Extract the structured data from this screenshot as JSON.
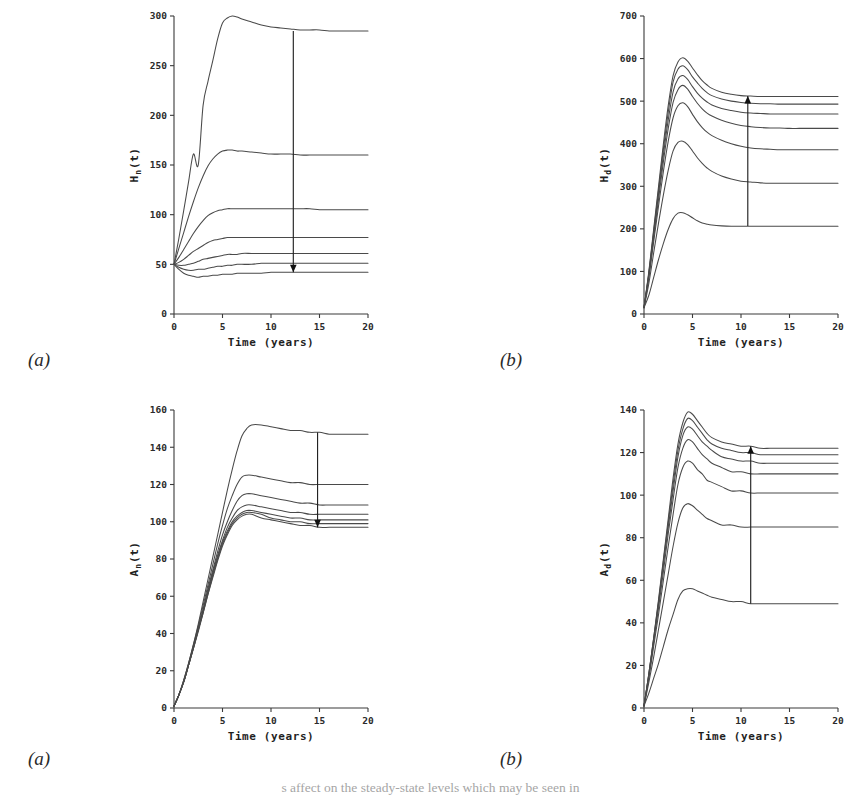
{
  "figure": {
    "panel_tags": [
      "(a)",
      "(b)",
      "(a)",
      "(b)"
    ],
    "caption_fragment": "s affect on the steady-state levels which may be seen in"
  },
  "chart_data": [
    {
      "id": "panel-top-left",
      "type": "line",
      "title": "",
      "xlabel": "Time (years)",
      "ylabel": "H_n(t)",
      "ylabel_base": "H",
      "ylabel_sub": "n",
      "ylabel_tail": "(t)",
      "xlim": [
        0,
        20
      ],
      "ylim": [
        0,
        300
      ],
      "xticks": [
        0,
        5,
        10,
        15,
        20
      ],
      "yticks": [
        0,
        50,
        100,
        150,
        200,
        250,
        300
      ],
      "grid": false,
      "legend": "none",
      "arrow": {
        "x": 12.3,
        "y_from": 285,
        "y_to": 42,
        "direction": "down"
      },
      "x": [
        0,
        0.5,
        1,
        1.5,
        2,
        2.5,
        3,
        3.5,
        4,
        4.5,
        5,
        5.5,
        6,
        6.5,
        7,
        8,
        9,
        10,
        11,
        12,
        13,
        14,
        15,
        16,
        17,
        18,
        19,
        20
      ],
      "series": [
        {
          "name": "curve-1",
          "values": [
            50,
            76,
            104,
            133,
            161,
            150,
            210,
            234,
            255,
            277,
            293,
            298,
            300,
            299,
            297,
            294,
            291,
            289,
            288,
            287,
            286,
            286,
            286,
            285,
            285,
            285,
            285,
            285
          ]
        },
        {
          "name": "curve-2",
          "values": [
            50,
            66,
            82,
            98,
            113,
            127,
            139,
            149,
            156,
            161,
            164,
            165,
            165,
            164,
            164,
            163,
            162,
            161,
            161,
            161,
            160,
            160,
            160,
            160,
            160,
            160,
            160,
            160
          ]
        },
        {
          "name": "curve-3",
          "values": [
            50,
            57,
            65,
            73,
            81,
            88,
            94,
            99,
            102,
            104,
            105,
            106,
            106,
            106,
            106,
            106,
            106,
            106,
            106,
            106,
            106,
            106,
            105,
            105,
            105,
            105,
            105,
            105
          ]
        },
        {
          "name": "curve-4",
          "values": [
            50,
            52,
            55,
            59,
            63,
            66,
            69,
            72,
            74,
            75,
            76,
            77,
            77,
            77,
            77,
            77,
            77,
            77,
            77,
            77,
            77,
            77,
            77,
            77,
            77,
            77,
            77,
            77
          ]
        },
        {
          "name": "curve-5",
          "values": [
            50,
            49,
            49,
            50,
            51,
            53,
            55,
            56,
            57,
            58,
            59,
            60,
            60,
            60,
            61,
            61,
            61,
            61,
            61,
            61,
            61,
            61,
            61,
            61,
            61,
            61,
            61,
            61
          ]
        },
        {
          "name": "curve-6",
          "values": [
            50,
            47,
            45,
            44,
            44,
            45,
            45,
            46,
            47,
            48,
            48,
            49,
            49,
            50,
            50,
            50,
            51,
            51,
            51,
            51,
            51,
            51,
            51,
            51,
            51,
            51,
            51,
            51
          ]
        },
        {
          "name": "curve-7",
          "values": [
            50,
            45,
            41,
            39,
            38,
            37,
            38,
            38,
            39,
            39,
            40,
            40,
            40,
            41,
            41,
            41,
            41,
            42,
            42,
            42,
            42,
            42,
            42,
            42,
            42,
            42,
            42,
            42
          ]
        }
      ]
    },
    {
      "id": "panel-top-right",
      "type": "line",
      "title": "",
      "xlabel": "Time (years)",
      "ylabel": "H_d(t)",
      "ylabel_base": "H",
      "ylabel_sub": "d",
      "ylabel_tail": "(t)",
      "xlim": [
        0,
        20
      ],
      "ylim": [
        0,
        700
      ],
      "xticks": [
        0,
        5,
        10,
        15,
        20
      ],
      "yticks": [
        0,
        100,
        200,
        300,
        400,
        500,
        600,
        700
      ],
      "grid": false,
      "legend": "none",
      "arrow": {
        "x": 10.7,
        "y_from": 207,
        "y_to": 512,
        "direction": "up"
      },
      "x": [
        0,
        0.5,
        1,
        1.5,
        2,
        2.5,
        3,
        3.5,
        4,
        4.5,
        5,
        5.5,
        6,
        6.5,
        7,
        8,
        9,
        10,
        11,
        12,
        13,
        14,
        15,
        16,
        17,
        18,
        19,
        20
      ],
      "series": [
        {
          "name": "curve-1",
          "values": [
            15,
            100,
            200,
            300,
            400,
            490,
            560,
            592,
            602,
            594,
            578,
            562,
            548,
            538,
            530,
            521,
            516,
            513,
            512,
            511,
            511,
            511,
            511,
            511,
            511,
            511,
            511,
            511
          ]
        },
        {
          "name": "curve-2",
          "values": [
            15,
            97,
            194,
            291,
            388,
            474,
            545,
            575,
            583,
            574,
            557,
            543,
            530,
            520,
            513,
            505,
            500,
            497,
            495,
            494,
            494,
            493,
            493,
            493,
            493,
            493,
            493,
            493
          ]
        },
        {
          "name": "curve-3",
          "values": [
            15,
            94,
            188,
            282,
            374,
            456,
            522,
            552,
            560,
            551,
            534,
            519,
            507,
            498,
            491,
            483,
            478,
            474,
            472,
            471,
            470,
            470,
            470,
            470,
            470,
            470,
            470,
            470
          ]
        },
        {
          "name": "curve-4",
          "values": [
            15,
            90,
            180,
            270,
            358,
            436,
            497,
            527,
            537,
            528,
            511,
            495,
            482,
            472,
            465,
            455,
            448,
            443,
            440,
            438,
            437,
            437,
            436,
            436,
            436,
            436,
            436,
            436
          ]
        },
        {
          "name": "curve-5",
          "values": [
            15,
            85,
            170,
            254,
            335,
            406,
            461,
            489,
            496,
            487,
            469,
            452,
            438,
            427,
            419,
            408,
            400,
            394,
            390,
            388,
            387,
            386,
            386,
            386,
            386,
            386,
            386,
            386
          ]
        },
        {
          "name": "curve-6",
          "values": [
            15,
            72,
            144,
            214,
            280,
            338,
            383,
            403,
            406,
            398,
            383,
            367,
            354,
            343,
            335,
            324,
            317,
            312,
            310,
            308,
            307,
            307,
            307,
            307,
            307,
            307,
            307,
            307
          ]
        },
        {
          "name": "curve-7",
          "values": [
            15,
            44,
            86,
            128,
            166,
            199,
            224,
            237,
            238,
            233,
            226,
            219,
            214,
            211,
            209,
            207,
            206,
            206,
            206,
            206,
            206,
            206,
            206,
            206,
            206,
            206,
            206,
            206
          ]
        }
      ]
    },
    {
      "id": "panel-bottom-left",
      "type": "line",
      "title": "",
      "xlabel": "Time (years)",
      "ylabel": "A_n(t)",
      "ylabel_base": "A",
      "ylabel_sub": "n",
      "ylabel_tail": "(t)",
      "xlim": [
        0,
        20
      ],
      "ylim": [
        0,
        160
      ],
      "xticks": [
        0,
        5,
        10,
        15,
        20
      ],
      "yticks": [
        0,
        20,
        40,
        60,
        80,
        100,
        120,
        140,
        160
      ],
      "grid": false,
      "legend": "none",
      "arrow": {
        "x": 14.8,
        "y_from": 148,
        "y_to": 97,
        "direction": "down"
      },
      "x": [
        0,
        0.5,
        1,
        1.5,
        2,
        2.5,
        3,
        3.5,
        4,
        4.5,
        5,
        5.5,
        6,
        6.5,
        7,
        7.5,
        8,
        9,
        10,
        11,
        12,
        13,
        14,
        15,
        16,
        17,
        18,
        19,
        20
      ],
      "series": [
        {
          "name": "curve-1",
          "values": [
            1,
            7,
            15,
            24,
            34,
            45,
            57,
            69,
            81,
            93,
            105,
            117,
            128,
            138,
            146,
            150,
            152,
            152,
            151,
            150,
            149,
            149,
            148,
            148,
            147,
            147,
            147,
            147,
            147
          ]
        },
        {
          "name": "curve-2",
          "values": [
            1,
            7,
            15,
            24,
            34,
            44,
            55,
            66,
            77,
            88,
            98,
            107,
            114,
            120,
            124,
            125,
            125,
            124,
            123,
            122,
            121,
            121,
            120,
            120,
            120,
            120,
            120,
            120,
            120
          ]
        },
        {
          "name": "curve-3",
          "values": [
            1,
            7,
            14,
            23,
            33,
            43,
            53,
            64,
            74,
            84,
            93,
            100,
            106,
            111,
            114,
            115,
            115,
            114,
            113,
            112,
            111,
            110,
            110,
            109,
            109,
            109,
            109,
            109,
            109
          ]
        },
        {
          "name": "curve-4",
          "values": [
            1,
            7,
            14,
            23,
            33,
            42,
            52,
            63,
            73,
            82,
            90,
            97,
            102,
            106,
            108,
            109,
            109,
            108,
            107,
            106,
            105,
            105,
            104,
            104,
            104,
            104,
            104,
            104,
            104
          ]
        },
        {
          "name": "curve-5",
          "values": [
            1,
            7,
            14,
            23,
            32,
            42,
            52,
            62,
            72,
            81,
            89,
            95,
            100,
            103,
            105,
            106,
            106,
            105,
            104,
            103,
            102,
            102,
            101,
            101,
            101,
            101,
            101,
            101,
            101
          ]
        },
        {
          "name": "curve-6",
          "values": [
            1,
            7,
            14,
            23,
            32,
            42,
            51,
            61,
            71,
            80,
            88,
            94,
            99,
            102,
            104,
            105,
            105,
            104,
            102,
            101,
            100,
            100,
            99,
            99,
            99,
            99,
            99,
            99,
            99
          ]
        },
        {
          "name": "curve-7",
          "values": [
            1,
            7,
            14,
            23,
            32,
            41,
            51,
            61,
            70,
            79,
            87,
            93,
            98,
            101,
            103,
            104,
            104,
            102,
            101,
            100,
            99,
            98,
            98,
            97,
            97,
            97,
            97,
            97,
            97
          ]
        }
      ]
    },
    {
      "id": "panel-bottom-right",
      "type": "line",
      "title": "",
      "xlabel": "Time (years)",
      "ylabel": "A_d(t)",
      "ylabel_base": "A",
      "ylabel_sub": "d",
      "ylabel_tail": "(t)",
      "xlim": [
        0,
        20
      ],
      "ylim": [
        0,
        140
      ],
      "xticks": [
        0,
        5,
        10,
        15,
        20
      ],
      "yticks": [
        0,
        20,
        40,
        60,
        80,
        100,
        120,
        140
      ],
      "grid": false,
      "legend": "none",
      "arrow": {
        "x": 11.0,
        "y_from": 49,
        "y_to": 123,
        "direction": "up"
      },
      "x": [
        0,
        0.5,
        1,
        1.5,
        2,
        2.5,
        3,
        3.5,
        4,
        4.5,
        5,
        5.5,
        6,
        6.5,
        7,
        8,
        9,
        10,
        11,
        12,
        13,
        14,
        15,
        16,
        17,
        18,
        19,
        20
      ],
      "series": [
        {
          "name": "curve-1",
          "values": [
            1,
            16,
            33,
            51,
            70,
            89,
            108,
            124,
            134,
            139,
            138,
            135,
            132,
            129,
            127,
            125,
            124,
            123,
            123,
            122,
            122,
            122,
            122,
            122,
            122,
            122,
            122,
            122
          ]
        },
        {
          "name": "curve-2",
          "values": [
            1,
            16,
            33,
            50,
            69,
            87,
            105,
            121,
            131,
            136,
            135,
            132,
            129,
            126,
            124,
            122,
            121,
            120,
            120,
            119,
            119,
            119,
            119,
            119,
            119,
            119,
            119,
            119
          ]
        },
        {
          "name": "curve-3",
          "values": [
            1,
            16,
            32,
            49,
            67,
            85,
            102,
            118,
            128,
            132,
            131,
            128,
            125,
            123,
            121,
            118,
            117,
            116,
            116,
            115,
            115,
            115,
            115,
            115,
            115,
            115,
            115,
            115
          ]
        },
        {
          "name": "curve-4",
          "values": [
            1,
            15,
            31,
            47,
            64,
            82,
            98,
            113,
            122,
            126,
            125,
            122,
            119,
            117,
            115,
            113,
            111,
            111,
            110,
            110,
            110,
            110,
            110,
            110,
            110,
            110,
            110,
            110
          ]
        },
        {
          "name": "curve-5",
          "values": [
            1,
            14,
            29,
            44,
            60,
            76,
            91,
            105,
            113,
            116,
            115,
            112,
            110,
            107,
            106,
            104,
            102,
            102,
            101,
            101,
            101,
            101,
            101,
            101,
            101,
            101,
            101,
            101
          ]
        },
        {
          "name": "curve-6",
          "values": [
            1,
            12,
            24,
            37,
            50,
            63,
            76,
            87,
            94,
            96,
            95,
            93,
            91,
            89,
            88,
            86,
            86,
            85,
            85,
            85,
            85,
            85,
            85,
            85,
            85,
            85,
            85,
            85
          ]
        },
        {
          "name": "curve-7",
          "values": [
            1,
            7,
            14,
            21,
            29,
            37,
            44,
            51,
            55,
            56,
            56,
            55,
            54,
            53,
            52,
            51,
            50,
            50,
            49,
            49,
            49,
            49,
            49,
            49,
            49,
            49,
            49,
            49
          ]
        }
      ]
    }
  ]
}
